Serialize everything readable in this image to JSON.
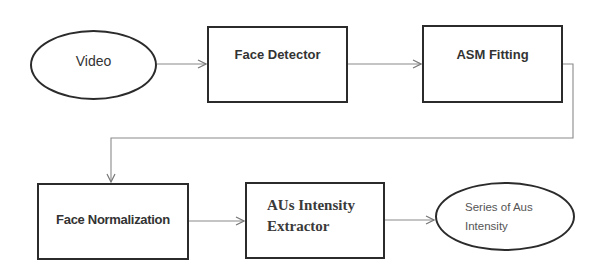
{
  "diagram": {
    "type": "flowchart",
    "nodes": [
      {
        "id": "video",
        "label": "Video",
        "shape": "ellipse"
      },
      {
        "id": "face_detector",
        "label": "Face Detector",
        "shape": "rectangle"
      },
      {
        "id": "asm_fitting",
        "label": "ASM Fitting",
        "shape": "rectangle"
      },
      {
        "id": "face_normalization",
        "label": "Face Normalization",
        "shape": "rectangle"
      },
      {
        "id": "aus_extractor",
        "label_line1": "AUs Intensity",
        "label_line2": "Extractor",
        "shape": "rectangle"
      },
      {
        "id": "series_output",
        "label_line1": "Series of Aus",
        "label_line2": "Intensity",
        "shape": "ellipse"
      }
    ],
    "edges": [
      {
        "from": "video",
        "to": "face_detector"
      },
      {
        "from": "face_detector",
        "to": "asm_fitting"
      },
      {
        "from": "asm_fitting",
        "to": "face_normalization"
      },
      {
        "from": "face_normalization",
        "to": "aus_extractor"
      },
      {
        "from": "aus_extractor",
        "to": "series_output"
      }
    ],
    "colors": {
      "stroke": "#2b2b2b",
      "connector": "#8a8a8a",
      "text": "#333333",
      "background": "#ffffff"
    }
  }
}
